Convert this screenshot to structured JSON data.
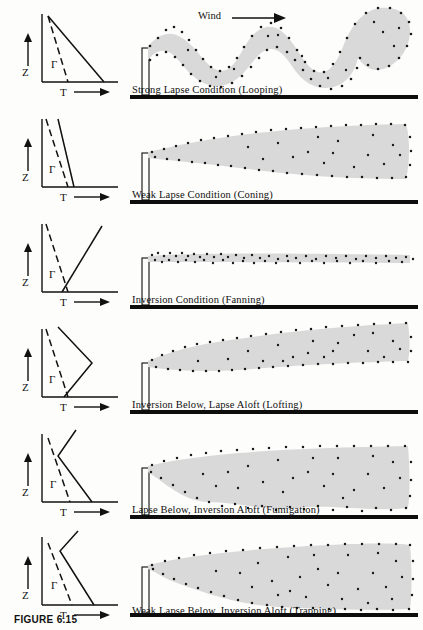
{
  "figure": {
    "caption_label": "FIGURE 6.15",
    "wind_label": "Wind",
    "wind_arrow_icon": "right-arrow-icon",
    "background_color": "#fdfdfb",
    "plume_fill_color": "#d9d9d9",
    "plume_dot_color": "#1a1a1a",
    "ground_color": "#0d0d0d"
  },
  "axes": {
    "y_label": "Z",
    "x_label": "T",
    "gamma_label": "Γ",
    "y_arrow_icon": "up-arrow-icon",
    "x_arrow_icon": "right-arrow-icon"
  },
  "panels": [
    {
      "id": "looping",
      "caption": "Strong Lapse Condition (Looping)",
      "stability": "strong lapse",
      "env_profile": "steeply decreasing temperature with height, to the right of the dry adiabat",
      "plume_shape": "large wavy looping plume with strong vertical excursions"
    },
    {
      "id": "coning",
      "caption": "Weak Lapse Condition (Coning)",
      "stability": "weak lapse",
      "env_profile": "slightly steeper than the dry adiabat",
      "plume_shape": "cone widening downwind"
    },
    {
      "id": "fanning",
      "caption": "Inversion Condition (Fanning)",
      "stability": "inversion",
      "env_profile": "temperature increasing with height, crossing the dry adiabat",
      "plume_shape": "thin flat horizontal ribbon"
    },
    {
      "id": "lofting",
      "caption": "Inversion Below, Lapse Aloft (Lofting)",
      "stability": "inversion below, lapse aloft",
      "env_profile": "inversion at the surface then lapse above, forming a right-pointing wedge",
      "plume_shape": "plume spreading upward only, flat underside"
    },
    {
      "id": "fumigation",
      "caption": "Lapse Below, Inversion Aloft (Fumigation)",
      "stability": "lapse below, inversion aloft",
      "env_profile": "lapse near surface then inversion above, forming a left-pointing wedge",
      "plume_shape": "plume spreading downward to the ground, flat top"
    },
    {
      "id": "trapping",
      "caption": "Weak Lapse Below, Inversion Aloft (Trapping)",
      "stability": "weak lapse below, inversion aloft",
      "env_profile": "weak lapse near surface capped by inversion aloft",
      "plume_shape": "plume confined between ground and a capping lid"
    }
  ]
}
